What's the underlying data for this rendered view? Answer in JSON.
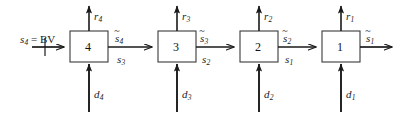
{
  "diagram": {
    "type": "block-flow-diagram",
    "stroke_color": "#1a1a1a",
    "background_color": "#ffffff",
    "blocks": [
      {
        "id": "stage-4",
        "label": "4",
        "x": 70,
        "y": 31,
        "w": 38,
        "h": 31
      },
      {
        "id": "stage-3",
        "label": "3",
        "x": 158,
        "y": 31,
        "w": 38,
        "h": 31
      },
      {
        "id": "stage-2",
        "label": "2",
        "x": 240,
        "y": 31,
        "w": 38,
        "h": 31
      },
      {
        "id": "stage-1",
        "label": "1",
        "x": 322,
        "y": 31,
        "w": 38,
        "h": 31
      }
    ],
    "inlet_label": {
      "s": "s",
      "sub": "4",
      "equals": " = BV"
    },
    "stream_labels": [
      {
        "id": "stream-tilde-s4",
        "base": "s",
        "sub": "4",
        "tilde": true,
        "x": 115,
        "y": 33
      },
      {
        "id": "stream-s3",
        "base": "s",
        "sub": "3",
        "tilde": false,
        "x": 117,
        "y": 54
      },
      {
        "id": "stream-tilde-s3",
        "base": "s",
        "sub": "3",
        "tilde": true,
        "x": 200,
        "y": 33
      },
      {
        "id": "stream-s2",
        "base": "s",
        "sub": "2",
        "tilde": false,
        "x": 202,
        "y": 54
      },
      {
        "id": "stream-tilde-s2",
        "base": "s",
        "sub": "2",
        "tilde": true,
        "x": 283,
        "y": 33
      },
      {
        "id": "stream-s1",
        "base": "s",
        "sub": "1",
        "tilde": false,
        "x": 285,
        "y": 54
      },
      {
        "id": "stream-tilde-s1",
        "base": "s",
        "sub": "1",
        "tilde": true,
        "x": 366,
        "y": 33
      }
    ],
    "outlet_labels": [
      {
        "id": "outlet-r4",
        "base": "r",
        "sub": "4",
        "x": 94,
        "y": 11
      },
      {
        "id": "outlet-r3",
        "base": "r",
        "sub": "3",
        "x": 182,
        "y": 11
      },
      {
        "id": "outlet-r2",
        "base": "r",
        "sub": "2",
        "x": 264,
        "y": 11
      },
      {
        "id": "outlet-r1",
        "base": "r",
        "sub": "1",
        "x": 346,
        "y": 11
      }
    ],
    "feed_labels": [
      {
        "id": "feed-d4",
        "base": "d",
        "sub": "4",
        "x": 94,
        "y": 92
      },
      {
        "id": "feed-d3",
        "base": "d",
        "sub": "3",
        "x": 182,
        "y": 92
      },
      {
        "id": "feed-d2",
        "base": "d",
        "sub": "2",
        "x": 264,
        "y": 92
      },
      {
        "id": "feed-d1",
        "base": "d",
        "sub": "1",
        "x": 346,
        "y": 92
      }
    ]
  }
}
